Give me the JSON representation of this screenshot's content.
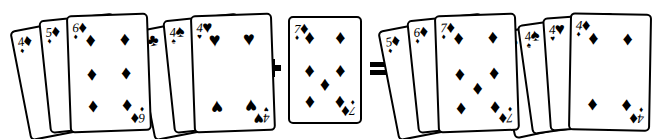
{
  "illustration": {
    "title": "Playing card sequence and set equation",
    "background_color": "#ffffff",
    "ink_color": "#000000",
    "card_face_color": "#ffffff"
  },
  "suit_glyphs": {
    "diamond": "♦",
    "heart": "♥",
    "spade": "♠",
    "club": "♣"
  },
  "operators": [
    {
      "name": "plus",
      "symbol": "+",
      "x": 261,
      "y": 57
    },
    {
      "name": "equals",
      "symbol": "=",
      "x": 368,
      "y": 57
    }
  ],
  "groups": [
    {
      "id": "group-left-run",
      "label": "four five six of diamonds",
      "x": 12,
      "cards": [
        {
          "rank": "4",
          "suit": "diamond",
          "rank_display": "4",
          "count": 4,
          "left": 18,
          "top": 22,
          "w": 76,
          "h": 112,
          "rot": -11,
          "z": 1,
          "show_pips": false,
          "show_bottom_index": false
        },
        {
          "rank": "5",
          "suit": "diamond",
          "rank_display": "5",
          "count": 5,
          "left": 38,
          "top": 16,
          "w": 76,
          "h": 114,
          "rot": -6,
          "z": 2,
          "show_pips": false,
          "show_bottom_index": false
        },
        {
          "rank": "6",
          "suit": "diamond",
          "rank_display": "6",
          "count": 6,
          "left": 58,
          "top": 14,
          "w": 82,
          "h": 118,
          "rot": -2,
          "z": 3,
          "show_pips": true,
          "show_bottom_index": true
        }
      ]
    },
    {
      "id": "group-left-set",
      "label": "three fours clubs spades hearts",
      "x": 148,
      "cards": [
        {
          "rank": "4",
          "suit": "club",
          "rank_display": "4",
          "count": 4,
          "left": 6,
          "top": 22,
          "w": 76,
          "h": 112,
          "rot": -11,
          "z": 1,
          "show_pips": false,
          "show_bottom_index": false
        },
        {
          "rank": "4",
          "suit": "spade",
          "rank_display": "4",
          "count": 4,
          "left": 26,
          "top": 16,
          "w": 76,
          "h": 114,
          "rot": -6,
          "z": 2,
          "show_pips": false,
          "show_bottom_index": false
        },
        {
          "rank": "4",
          "suit": "heart",
          "rank_display": "4",
          "count": 4,
          "left": 46,
          "top": 14,
          "w": 82,
          "h": 118,
          "rot": -2,
          "z": 3,
          "show_pips": true,
          "show_bottom_index": true
        }
      ]
    },
    {
      "id": "group-single",
      "label": "seven of diamonds",
      "x": 288,
      "cards": [
        {
          "rank": "7",
          "suit": "diamond",
          "rank_display": "7",
          "count": 7,
          "left": 0,
          "top": 16,
          "w": 74,
          "h": 108,
          "rot": 0,
          "z": 1,
          "show_pips": true,
          "show_bottom_index": true
        }
      ]
    },
    {
      "id": "group-right-run",
      "label": "five six seven of diamonds",
      "x": 392,
      "cards": [
        {
          "rank": "5",
          "suit": "diamond",
          "rank_display": "5",
          "count": 5,
          "left": 6,
          "top": 22,
          "w": 76,
          "h": 112,
          "rot": -11,
          "z": 1,
          "show_pips": false,
          "show_bottom_index": false
        },
        {
          "rank": "6",
          "suit": "diamond",
          "rank_display": "6",
          "count": 6,
          "left": 26,
          "top": 16,
          "w": 76,
          "h": 114,
          "rot": -6,
          "z": 2,
          "show_pips": false,
          "show_bottom_index": false
        },
        {
          "rank": "7",
          "suit": "diamond",
          "rank_display": "7",
          "count": 7,
          "left": 46,
          "top": 14,
          "w": 82,
          "h": 118,
          "rot": -2,
          "z": 3,
          "show_pips": true,
          "show_bottom_index": true
        }
      ]
    },
    {
      "id": "group-right-set",
      "label": "four fours clubs spades hearts diamonds",
      "x": 512,
      "cards": [
        {
          "rank": "4",
          "suit": "club",
          "rank_display": "4",
          "count": 4,
          "left": 2,
          "top": 24,
          "w": 72,
          "h": 108,
          "rot": -12,
          "z": 1,
          "show_pips": false,
          "show_bottom_index": false
        },
        {
          "rank": "4",
          "suit": "spade",
          "rank_display": "4",
          "count": 4,
          "left": 20,
          "top": 19,
          "w": 72,
          "h": 111,
          "rot": -8,
          "z": 2,
          "show_pips": false,
          "show_bottom_index": false
        },
        {
          "rank": "4",
          "suit": "heart",
          "rank_display": "4",
          "count": 4,
          "left": 38,
          "top": 15,
          "w": 72,
          "h": 114,
          "rot": -4,
          "z": 3,
          "show_pips": false,
          "show_bottom_index": false
        },
        {
          "rank": "4",
          "suit": "diamond",
          "rank_display": "4",
          "count": 4,
          "left": 56,
          "top": 13,
          "w": 82,
          "h": 118,
          "rot": 1,
          "z": 4,
          "show_pips": true,
          "show_bottom_index": true
        }
      ]
    }
  ]
}
